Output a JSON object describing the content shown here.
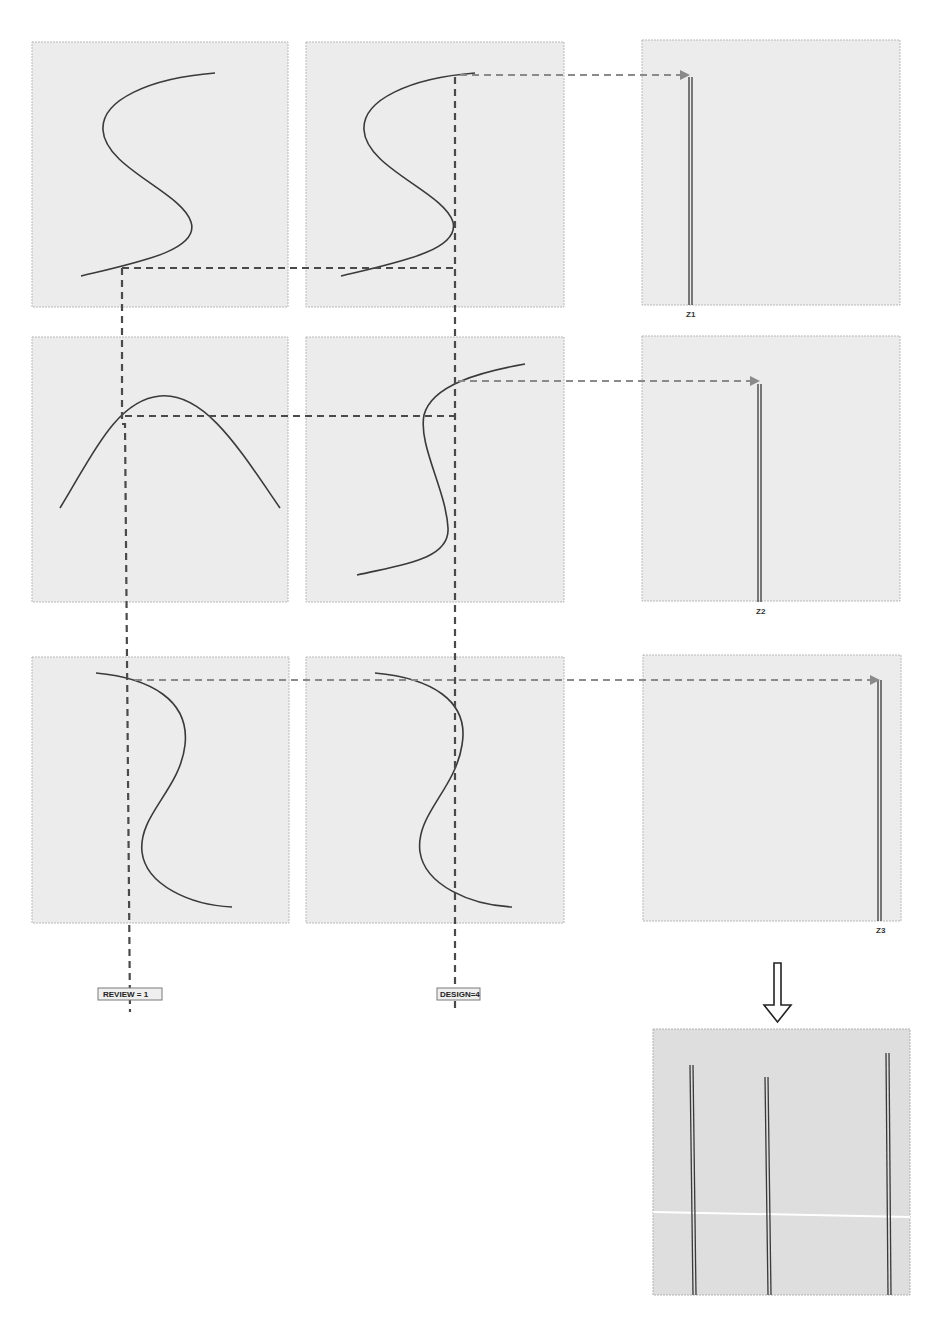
{
  "diagram": {
    "colors": {
      "panel_fill": "#ececec",
      "result_panel_fill": "#dedede",
      "curve_stroke": "#3a3a3a",
      "dashed_guide_dark": "#4a4a4a",
      "dashed_arrow_grey": "#8a8a8a"
    },
    "rows": [
      {
        "id": "row-1",
        "left_curve": "s-curve",
        "middle_curve": "s-curve",
        "output_label": "Z1"
      },
      {
        "id": "row-2",
        "left_curve": "arch-curve",
        "middle_curve": "s-curve-narrow",
        "output_label": "Z2"
      },
      {
        "id": "row-3",
        "left_curve": "reverse-s-curve",
        "middle_curve": "reverse-s-curve",
        "output_label": "Z3"
      }
    ],
    "tags": {
      "review": "REVIEW = 1",
      "design": "DESIGN=4"
    },
    "result_panel": {
      "line_count": 3,
      "arrow_icon": "down-arrow-icon"
    }
  }
}
